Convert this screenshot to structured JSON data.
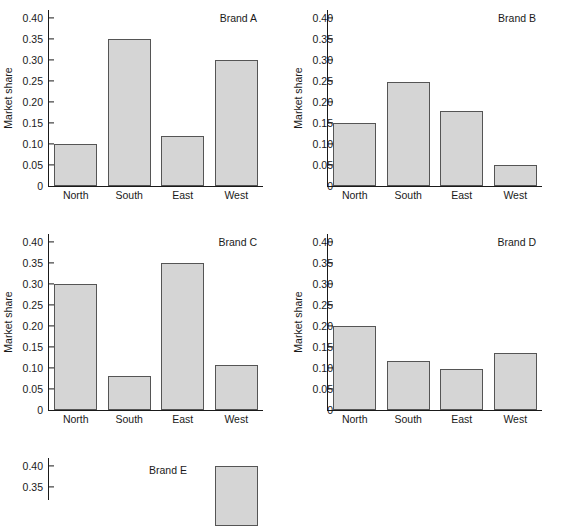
{
  "figure": {
    "axis_label_y": "Market share",
    "categories": [
      "North",
      "South",
      "East",
      "West"
    ],
    "y_ticks": [
      "0.40",
      "0.35",
      "0.30",
      "0.25",
      "0.20",
      "0.15",
      "0.10",
      "0.05",
      "0"
    ],
    "y_tick_values": [
      0.4,
      0.35,
      0.3,
      0.25,
      0.2,
      0.15,
      0.1,
      0.05,
      0
    ],
    "bar_fill": "#d5d5d5",
    "bar_edge": "#555555",
    "axis_color": "#1a1a1a",
    "background": "#ffffff"
  },
  "panels": [
    {
      "title": "Brand A"
    },
    {
      "title": "Brand B"
    },
    {
      "title": "Brand C"
    },
    {
      "title": "Brand D"
    },
    {
      "title": "Brand E"
    }
  ],
  "chart_data": [
    {
      "type": "bar",
      "title": "Brand A",
      "categories": [
        "North",
        "South",
        "East",
        "West"
      ],
      "values": [
        0.1,
        0.35,
        0.12,
        0.3
      ],
      "xlabel": "",
      "ylabel": "Market share",
      "ylim": [
        0,
        0.42
      ],
      "yticks": [
        0,
        0.05,
        0.1,
        0.15,
        0.2,
        0.25,
        0.3,
        0.35,
        0.4
      ],
      "grid": false,
      "legend": "none"
    },
    {
      "type": "bar",
      "title": "Brand B",
      "categories": [
        "North",
        "South",
        "East",
        "West"
      ],
      "values": [
        0.15,
        0.248,
        0.178,
        0.05
      ],
      "xlabel": "",
      "ylabel": "Market share",
      "ylim": [
        0,
        0.42
      ],
      "yticks": [
        0,
        0.05,
        0.1,
        0.15,
        0.2,
        0.25,
        0.3,
        0.35,
        0.4
      ],
      "grid": false,
      "legend": "none"
    },
    {
      "type": "bar",
      "title": "Brand C",
      "categories": [
        "North",
        "South",
        "East",
        "West"
      ],
      "values": [
        0.3,
        0.08,
        0.35,
        0.108
      ],
      "xlabel": "",
      "ylabel": "Market share",
      "ylim": [
        0,
        0.42
      ],
      "yticks": [
        0,
        0.05,
        0.1,
        0.15,
        0.2,
        0.25,
        0.3,
        0.35,
        0.4
      ],
      "grid": false,
      "legend": "none"
    },
    {
      "type": "bar",
      "title": "Brand D",
      "categories": [
        "North",
        "South",
        "East",
        "West"
      ],
      "values": [
        0.2,
        0.118,
        0.098,
        0.137
      ],
      "xlabel": "",
      "ylabel": "Market share",
      "ylim": [
        0,
        0.42
      ],
      "yticks": [
        0,
        0.05,
        0.1,
        0.15,
        0.2,
        0.25,
        0.3,
        0.35,
        0.4
      ],
      "grid": false,
      "legend": "none"
    },
    {
      "type": "bar",
      "title": "Brand E",
      "categories": [
        "North",
        "South",
        "East",
        "West"
      ],
      "values": [
        null,
        null,
        null,
        0.4
      ],
      "xlabel": "",
      "ylabel": "Market share",
      "ylim": [
        0,
        0.42
      ],
      "yticks": [
        0.4,
        0.35,
        0.3
      ],
      "grid": false,
      "legend": "none",
      "note": "panel clipped by bottom edge of image; only West bar and top of axis visible"
    }
  ]
}
